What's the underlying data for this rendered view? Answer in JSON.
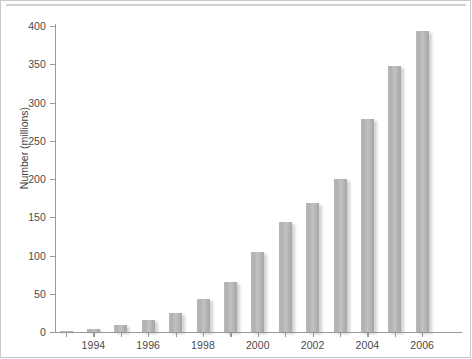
{
  "chart_data": {
    "type": "bar",
    "title": "",
    "subtitle": "",
    "xlabel": "",
    "ylabel": "Number (millions)",
    "categories": [
      "1993",
      "1994",
      "1995",
      "1996",
      "1997",
      "1998",
      "1999",
      "2000",
      "2001",
      "2002",
      "2003",
      "2004",
      "2005",
      "2006"
    ],
    "values": [
      1,
      4,
      9,
      16,
      25,
      43,
      65,
      104,
      144,
      169,
      200,
      278,
      348,
      393
    ],
    "x_tick_labels": [
      "1994",
      "1996",
      "1998",
      "2000",
      "2002",
      "2004",
      "2006"
    ],
    "x_tick_categories": [
      "1994",
      "1996",
      "1998",
      "2000",
      "2002",
      "2004",
      "2006"
    ],
    "y_tick_labels": [
      "0",
      "50",
      "100",
      "150",
      "200",
      "250",
      "300",
      "350",
      "400"
    ],
    "y_tick_values": [
      0,
      50,
      100,
      150,
      200,
      250,
      300,
      350,
      400
    ],
    "ylim": [
      0,
      400
    ],
    "grid": false,
    "legend": null,
    "legend_position": "none",
    "bar_color": "#b4b4b4",
    "axis_color": "#9a9a9a",
    "text_color": "#4b4b4b",
    "background_color": "#ffffff"
  }
}
